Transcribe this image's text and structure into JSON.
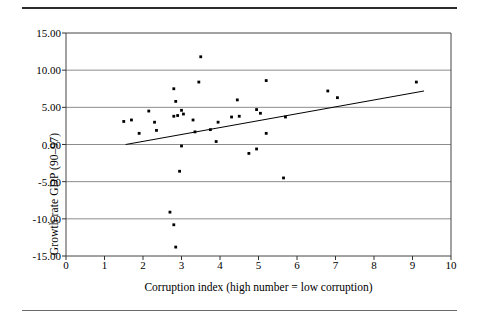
{
  "figure": {
    "has_top_rule": true,
    "has_bottom_rule": true
  },
  "chart_data": {
    "type": "scatter",
    "title": "",
    "xlabel": "Corruption index  (high number = low corruption)",
    "ylabel": "Growth rate GDP (90–97)",
    "xlim": [
      0,
      10
    ],
    "ylim": [
      -15,
      15
    ],
    "xticks": [
      0,
      1,
      2,
      3,
      4,
      5,
      6,
      7,
      8,
      9,
      10
    ],
    "xticklabels": [
      "0",
      "1",
      "2",
      "3",
      "4",
      "5",
      "6",
      "7",
      "8",
      "9",
      "10"
    ],
    "yticks": [
      15,
      10,
      5,
      0,
      -5,
      -10,
      -15
    ],
    "yticklabels": [
      "15.00",
      "10.00",
      "5.00",
      "0.00",
      "-5.00",
      "-10.00",
      "-15.00"
    ],
    "grid": "horizontal",
    "legend": null,
    "marker": "square-dot",
    "marker_color": "#000000",
    "series": [
      {
        "name": "countries",
        "points": [
          [
            1.5,
            3.1
          ],
          [
            1.7,
            3.3
          ],
          [
            1.9,
            1.5
          ],
          [
            2.15,
            4.5
          ],
          [
            2.3,
            3.0
          ],
          [
            2.35,
            1.9
          ],
          [
            2.7,
            -9.1
          ],
          [
            2.8,
            -10.8
          ],
          [
            2.8,
            7.5
          ],
          [
            2.8,
            3.8
          ],
          [
            2.85,
            -13.8
          ],
          [
            2.85,
            5.8
          ],
          [
            2.9,
            3.9
          ],
          [
            2.95,
            -3.6
          ],
          [
            3.0,
            4.6
          ],
          [
            3.05,
            4.1
          ],
          [
            3.0,
            -0.2
          ],
          [
            3.3,
            3.3
          ],
          [
            3.35,
            1.7
          ],
          [
            3.45,
            8.4
          ],
          [
            3.5,
            11.8
          ],
          [
            3.75,
            2.0
          ],
          [
            3.9,
            0.4
          ],
          [
            3.95,
            3.0
          ],
          [
            4.3,
            3.7
          ],
          [
            4.45,
            6.0
          ],
          [
            4.5,
            3.8
          ],
          [
            4.75,
            -1.2
          ],
          [
            4.95,
            4.7
          ],
          [
            4.95,
            -0.6
          ],
          [
            5.05,
            4.2
          ],
          [
            5.2,
            8.6
          ],
          [
            5.2,
            1.5
          ],
          [
            5.65,
            -4.5
          ],
          [
            5.7,
            3.7
          ],
          [
            6.8,
            7.2
          ],
          [
            7.05,
            6.3
          ],
          [
            9.1,
            8.4
          ]
        ]
      }
    ],
    "trendline": {
      "name": "linear fit",
      "x_start": 1.55,
      "y_start": 0.0,
      "x_end": 9.3,
      "y_end": 7.2,
      "color": "#000000"
    }
  }
}
